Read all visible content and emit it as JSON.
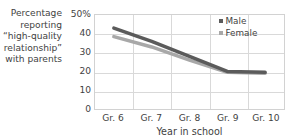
{
  "chart_data": {
    "type": "line",
    "title": "",
    "ylabel_lines": [
      "Percentage",
      "reporting",
      "“high-quality",
      "relationship”",
      "with parents"
    ],
    "xlabel": "Year in school",
    "categories": [
      "Gr. 6",
      "Gr. 7",
      "Gr. 8",
      "Gr. 9",
      "Gr. 10"
    ],
    "ylim": [
      0,
      50
    ],
    "yticks": [
      0,
      10,
      20,
      30,
      40,
      50
    ],
    "ytick_labels": [
      "0",
      "10",
      "20",
      "30",
      "40",
      "50%"
    ],
    "grid": true,
    "legend_position": "top-right",
    "series": [
      {
        "name": "Male",
        "color": "#5b5b5b",
        "values": [
          43,
          36,
          28,
          20,
          19.5
        ]
      },
      {
        "name": "Female",
        "color": "#a8a8a8",
        "values": [
          38.5,
          33,
          26,
          19.5,
          19
        ]
      }
    ]
  },
  "legend": {
    "items": [
      {
        "label": "Male",
        "color": "#5b5b5b"
      },
      {
        "label": "Female",
        "color": "#a8a8a8"
      }
    ]
  },
  "colors": {
    "axis": "#d2d2d2",
    "grid": "#d9d9d9",
    "text": "#3f3f3f",
    "male": "#5b5b5b",
    "female": "#a8a8a8"
  }
}
